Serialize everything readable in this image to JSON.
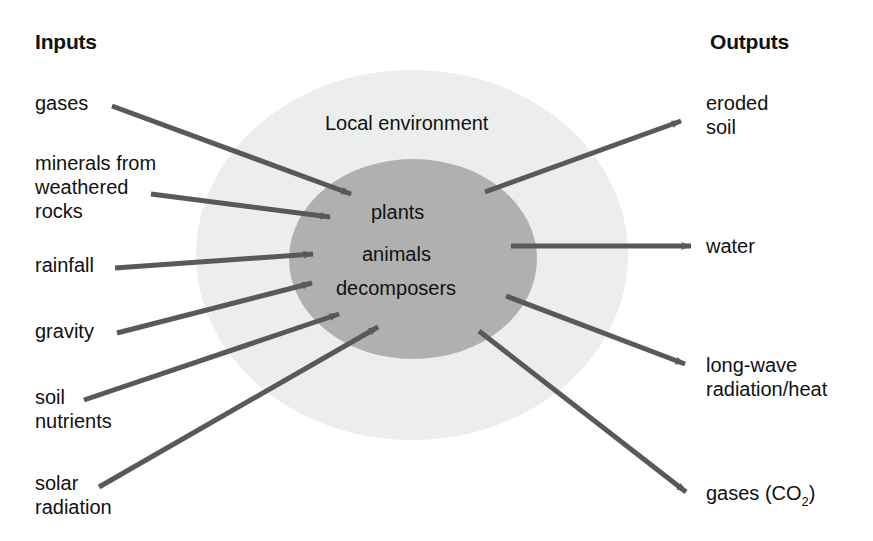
{
  "diagram": {
    "title_left": "Inputs",
    "title_right": "Outputs",
    "environment_label": "Local environment",
    "center_items": [
      "plants",
      "animals",
      "decomposers"
    ],
    "colors": {
      "outer_ellipse": "#eceded",
      "inner_ellipse": "#b0b0b0",
      "arrow": "#595959",
      "text": "#111111",
      "background": "#ffffff"
    },
    "inputs": [
      {
        "label": "gases",
        "lines": [
          "gases"
        ]
      },
      {
        "label": "minerals from weathered rocks",
        "lines": [
          "minerals from",
          "weathered",
          "rocks"
        ]
      },
      {
        "label": "rainfall",
        "lines": [
          "rainfall"
        ]
      },
      {
        "label": "gravity",
        "lines": [
          "gravity"
        ]
      },
      {
        "label": "soil nutrients",
        "lines": [
          "soil",
          "nutrients"
        ]
      },
      {
        "label": "solar radiation",
        "lines": [
          "solar",
          "radiation"
        ]
      }
    ],
    "outputs": [
      {
        "label": "eroded soil",
        "lines": [
          "eroded",
          "soil"
        ]
      },
      {
        "label": "water",
        "lines": [
          "water"
        ]
      },
      {
        "label": "long-wave radiation/heat",
        "lines": [
          "long-wave",
          "radiation/heat"
        ]
      },
      {
        "label": "gases (CO2)",
        "lines": [
          "gases (CO"
        ],
        "subscript": "2",
        "suffix": ")"
      }
    ]
  }
}
